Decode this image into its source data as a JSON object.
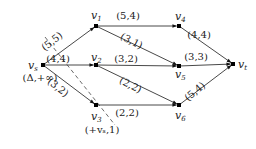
{
  "diagram": {
    "type": "flow-network",
    "nodes": [
      {
        "id": "vs",
        "label": "v",
        "sub": "s",
        "x": 43,
        "y": 65,
        "annotation": "(Δ,+∞)"
      },
      {
        "id": "v1",
        "label": "v",
        "sub": "1",
        "x": 96,
        "y": 26
      },
      {
        "id": "v2",
        "label": "v",
        "sub": "2",
        "x": 96,
        "y": 65
      },
      {
        "id": "v3",
        "label": "v",
        "sub": "3",
        "x": 96,
        "y": 105,
        "annotation": "(+vₛ,1)"
      },
      {
        "id": "v4",
        "label": "v",
        "sub": "4",
        "x": 179,
        "y": 26
      },
      {
        "id": "v5",
        "label": "v",
        "sub": "5",
        "x": 179,
        "y": 66
      },
      {
        "id": "v6",
        "label": "v",
        "sub": "6",
        "x": 179,
        "y": 105
      },
      {
        "id": "vt",
        "label": "v",
        "sub": "t",
        "x": 233,
        "y": 64
      }
    ],
    "edges": [
      {
        "from": "vs",
        "to": "v1",
        "label": "(5,5)"
      },
      {
        "from": "vs",
        "to": "v2",
        "label": "(4,4)"
      },
      {
        "from": "vs",
        "to": "v3",
        "label": "(3,2)"
      },
      {
        "from": "v1",
        "to": "v4",
        "label": "(5,4)"
      },
      {
        "from": "v1",
        "to": "v5",
        "label": "(3,1)"
      },
      {
        "from": "v2",
        "to": "v5",
        "label": "(3,2)"
      },
      {
        "from": "v2",
        "to": "v6",
        "label": "(2,2)"
      },
      {
        "from": "v3",
        "to": "v6",
        "label": "(2,2)"
      },
      {
        "from": "v4",
        "to": "vt",
        "label": "(4,4)"
      },
      {
        "from": "v5",
        "to": "vt",
        "label": "(3,3)"
      },
      {
        "from": "v6",
        "to": "vt",
        "label": "(5,4)"
      }
    ],
    "cut_line": {
      "x1": 45,
      "y1": 37,
      "x2": 115,
      "y2": 125,
      "style": "dashed"
    }
  }
}
